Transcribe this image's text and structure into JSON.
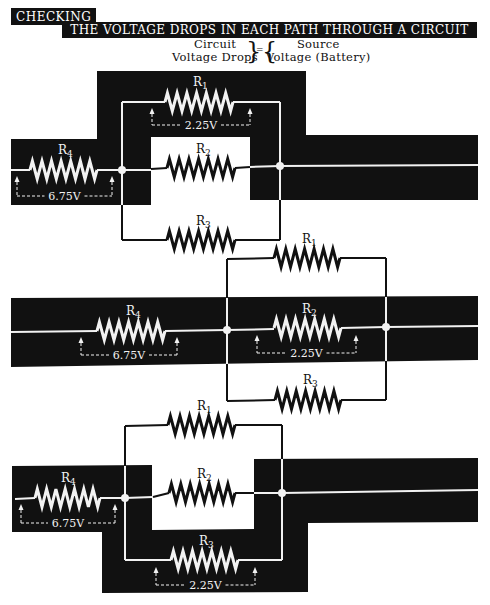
{
  "header": {
    "tag": "CHECKING",
    "title": "THE VOLTAGE DROPS IN EACH PATH THROUGH A CIRCUIT"
  },
  "equation": {
    "left_line1": "Circuit",
    "left_line2": "Voltage Drops",
    "equals": "=",
    "right_line1": "Source",
    "right_line2": "Voltage (Battery)"
  },
  "colors": {
    "highlight": "#111111",
    "wire_on_dark": "#f2f2f2",
    "wire_on_light": "#111111",
    "background": "#ffffff"
  },
  "diagrams": [
    {
      "id": "path-r4-r1",
      "highlighted_path": [
        "R4",
        "R1"
      ],
      "resistors": [
        {
          "label": "R",
          "sub": "4",
          "x1": 30,
          "x2": 97,
          "y": 170,
          "lx": 58,
          "ly": 154,
          "on_dark": true
        },
        {
          "label": "R",
          "sub": "1",
          "x1": 165,
          "x2": 233,
          "y": 102,
          "lx": 193,
          "ly": 86,
          "on_dark": true
        },
        {
          "label": "R",
          "sub": "2",
          "x1": 167,
          "x2": 235,
          "y": 168,
          "lx": 196,
          "ly": 153,
          "on_dark": false
        },
        {
          "label": "R",
          "sub": "3",
          "x1": 167,
          "x2": 235,
          "y": 240,
          "lx": 196,
          "ly": 225,
          "on_dark": false
        }
      ],
      "drops": [
        {
          "value": "6.75V",
          "xa": 17,
          "xb": 112,
          "y_wire": 170,
          "y_line": 196
        },
        {
          "value": "2.25V",
          "xa": 152,
          "xb": 250,
          "y_wire": 102,
          "y_line": 125
        }
      ]
    },
    {
      "id": "path-r4-r2",
      "highlighted_path": [
        "R4",
        "R2"
      ],
      "resistors": [
        {
          "label": "R",
          "sub": "4",
          "x1": 97,
          "x2": 165,
          "y": 331,
          "lx": 126,
          "ly": 315,
          "on_dark": true
        },
        {
          "label": "R",
          "sub": "1",
          "x1": 274,
          "x2": 340,
          "y": 258,
          "lx": 302,
          "ly": 243,
          "on_dark": false
        },
        {
          "label": "R",
          "sub": "2",
          "x1": 274,
          "x2": 341,
          "y": 328,
          "lx": 302,
          "ly": 313,
          "on_dark": true
        },
        {
          "label": "R",
          "sub": "3",
          "x1": 275,
          "x2": 341,
          "y": 400,
          "lx": 303,
          "ly": 384,
          "on_dark": false
        }
      ],
      "drops": [
        {
          "value": "6.75V",
          "xa": 81,
          "xb": 177,
          "y_wire": 331,
          "y_line": 355
        },
        {
          "value": "2.25V",
          "xa": 257,
          "xb": 356,
          "y_wire": 329,
          "y_line": 353
        }
      ]
    },
    {
      "id": "path-r4-r3",
      "highlighted_path": [
        "R4",
        "R3"
      ],
      "resistors": [
        {
          "label": "R",
          "sub": "4",
          "x1": 35,
          "x2": 100,
          "y": 498,
          "lx": 61,
          "ly": 482,
          "on_dark": true
        },
        {
          "label": "R",
          "sub": "1",
          "x1": 168,
          "x2": 235,
          "y": 425,
          "lx": 197,
          "ly": 410,
          "on_dark": false
        },
        {
          "label": "R",
          "sub": "2",
          "x1": 169,
          "x2": 235,
          "y": 493,
          "lx": 197,
          "ly": 478,
          "on_dark": false
        },
        {
          "label": "R",
          "sub": "3",
          "x1": 171,
          "x2": 238,
          "y": 560,
          "lx": 199,
          "ly": 545,
          "on_dark": true
        }
      ],
      "drops": [
        {
          "value": "6.75V",
          "xa": 21,
          "xb": 115,
          "y_wire": 498,
          "y_line": 523
        },
        {
          "value": "2.25V",
          "xa": 156,
          "xb": 255,
          "y_wire": 561,
          "y_line": 585
        }
      ]
    }
  ]
}
